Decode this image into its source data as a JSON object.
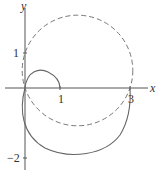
{
  "figure": {
    "x_axis_label": "x",
    "y_axis_label": "y",
    "x_ticks": [
      "1",
      "3"
    ],
    "y_ticks": [
      "1",
      "−2"
    ],
    "colors": {
      "axis": "#555555",
      "curve": "#666666"
    }
  },
  "curves": [
    {
      "name": "dashed-circle",
      "style": "dashed",
      "passes_through": [
        [
          0,
          0
        ],
        [
          3,
          0
        ],
        [
          0,
          1
        ]
      ]
    },
    {
      "name": "solid-limacon",
      "style": "solid",
      "inner_loop_x_intercept": 1,
      "outer_loop_x_intercept": 3
    }
  ]
}
